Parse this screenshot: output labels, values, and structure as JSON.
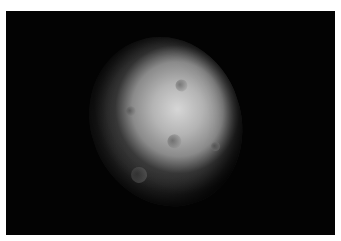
{
  "image": {
    "subject": "cratered moon partially in shadow",
    "background_color": "#030303",
    "border_color": "#ffffff",
    "highlight_color": "#d6d6d6",
    "shadow_color": "#1a1a1a"
  }
}
